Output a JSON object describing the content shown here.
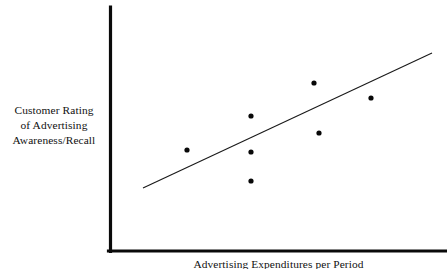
{
  "chart_data": {
    "type": "scatter",
    "title": "",
    "subtitle": "",
    "xlabel": "Advertising Expenditures per Period",
    "ylabel_lines": [
      "Customer Rating",
      "of Advertising",
      "Awareness/Recall"
    ],
    "ylabel": "Customer Rating of Advertising Awareness/Recall",
    "grid": false,
    "legend": null,
    "axis_ticks": {
      "x": [],
      "y": []
    },
    "xlim": [
      0,
      100
    ],
    "ylim": [
      0,
      100
    ],
    "axes": {
      "style": "L-shaped",
      "color": "#0a0a0a",
      "x_axis_px": {
        "x1": 110,
        "y1": 251,
        "x2": 447,
        "y2": 251
      },
      "y_axis_px": {
        "x1": 110,
        "y1": 7,
        "x2": 110,
        "y2": 251
      }
    },
    "points_px": [
      {
        "x": 187,
        "y": 150
      },
      {
        "x": 251,
        "y": 116
      },
      {
        "x": 251,
        "y": 152
      },
      {
        "x": 251,
        "y": 181
      },
      {
        "x": 314,
        "y": 83
      },
      {
        "x": 319,
        "y": 133
      },
      {
        "x": 371,
        "y": 98
      }
    ],
    "x": [
      22.8,
      41.8,
      41.8,
      41.8,
      60.5,
      62.0,
      77.4
    ],
    "y": [
      41.4,
      55.3,
      40.6,
      28.7,
      68.9,
      48.4,
      62.7
    ],
    "point_color": "#080808",
    "point_radius_px": 2.6,
    "trendline": {
      "label": "",
      "color": "#1a1a1a",
      "x1_px": 143,
      "y1_px": 188,
      "x2_px": 432,
      "y2_px": 53,
      "x1": 9.8,
      "y1": 25.8,
      "x2": 95.5,
      "y2": 81.1
    }
  }
}
